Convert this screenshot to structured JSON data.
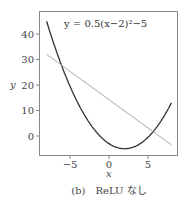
{
  "chart_data": {
    "type": "line",
    "title": "",
    "annotation": "y = 0.5(x−2)²−5",
    "xlabel": "x",
    "ylabel": "y",
    "xlim": [
      -8.8,
      8.9
    ],
    "ylim": [
      -7.5,
      49
    ],
    "xticks": [
      -5,
      0,
      5
    ],
    "xtick_labels": [
      "−5",
      "0",
      "5"
    ],
    "yticks": [
      0,
      10,
      20,
      30,
      40
    ],
    "ytick_labels": [
      "0",
      "10",
      "20",
      "30",
      "40"
    ],
    "grid": false,
    "legend": null,
    "series": [
      {
        "name": "y = 0.5(x−2)²−5",
        "color": "#333333",
        "x": [
          -8,
          -7,
          -6,
          -5,
          -4,
          -3,
          -2,
          -1,
          0,
          1,
          2,
          3,
          4,
          5,
          6,
          7,
          8
        ],
        "y": [
          45,
          35.5,
          27,
          19.5,
          13,
          7.5,
          3,
          -0.5,
          -3,
          -4.5,
          -5,
          -4.5,
          -3,
          -0.5,
          3,
          7.5,
          13
        ]
      },
      {
        "name": "linear fit",
        "color": "#aaaaaa",
        "x": [
          -8,
          8
        ],
        "y": [
          32,
          -3.5
        ]
      }
    ]
  },
  "caption": "(b)　ReLU なし"
}
